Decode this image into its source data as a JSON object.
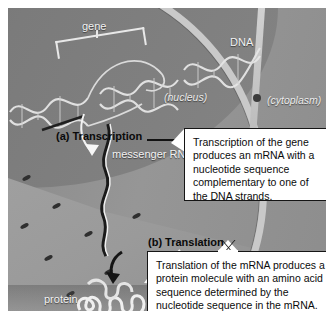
{
  "figure": {
    "style": "grayscale-photorealistic-illustration"
  },
  "labels": {
    "gene": "gene",
    "dna": "DNA",
    "nucleus": "(nucleus)",
    "cytoplasm": "(cytoplasm)",
    "messenger_rna": "messenger RNA",
    "protein": "protein",
    "step_a": "(a) Transcription",
    "step_b": "(b) Translation"
  },
  "callouts": [
    {
      "id": "transcription",
      "points_at": "(a) Transcription",
      "text": "Transcription of the gene produces an mRNA with a nucleotide sequence complementary to one of the DNA strands."
    },
    {
      "id": "translation",
      "points_at": "(b) Translation",
      "text": "Translation of the mRNA produces a protein molecule with an amino acid sequence determined by the nucleotide sequence in the mRNA."
    }
  ],
  "structures": [
    {
      "name": "dna-double-helix",
      "location": "upper-left, diagonal"
    },
    {
      "name": "nuclear-envelope",
      "location": "curving band lower-left to upper-right"
    },
    {
      "name": "nuclear-pore",
      "location": "membrane"
    },
    {
      "name": "mrna-strand",
      "location": "center, crossing membrane"
    },
    {
      "name": "protein-molecule",
      "location": "lower-left, folded chain"
    }
  ],
  "colors": {
    "background": "#8e8e8e",
    "nucleus": "#767676",
    "membrane": "#c9c9c9",
    "callout_bg": "#ffffff",
    "callout_border": "#151515",
    "label_light": "#f2f2f2",
    "label_dark": "#0a0a0a"
  }
}
